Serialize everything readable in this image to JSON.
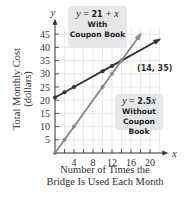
{
  "chart_data": {
    "type": "line",
    "title": "",
    "xlabel": "Number of Times the Bridge Is Used Each Month",
    "ylabel": "Total Monthly Cost (dollars)",
    "xlabel_line1": "Number of Times the",
    "xlabel_line2": "Bridge Is Used Each Month",
    "ylabel_line1": "Total Monthly Cost",
    "ylabel_line2": "(dollars)",
    "x_axis_name": "x",
    "y_axis_name": "y",
    "xlim": [
      0,
      22
    ],
    "ylim": [
      0,
      48
    ],
    "x_ticks": [
      4,
      8,
      12,
      16,
      20
    ],
    "y_ticks": [
      5,
      10,
      15,
      20,
      25,
      30,
      35,
      40,
      45
    ],
    "grid": true,
    "series": [
      {
        "name": "With Coupon Book",
        "equation": "y = 21 + x",
        "color": "#333333",
        "x": [
          0,
          2,
          4,
          10,
          12,
          14,
          22
        ],
        "y": [
          21,
          23,
          25,
          31,
          33,
          35,
          43
        ]
      },
      {
        "name": "Without Coupon Book",
        "equation": "y = 2.5x",
        "color": "#8a8a8a",
        "x": [
          0,
          2,
          4,
          10,
          12,
          14,
          18
        ],
        "y": [
          0,
          5,
          10,
          25,
          30,
          35,
          45
        ]
      }
    ],
    "annotations": [
      {
        "text": "(14, 35)",
        "x": 14,
        "y": 35
      }
    ]
  },
  "callouts": {
    "with": {
      "eq_y": "y",
      "eq_rest": " = ",
      "eq_num": "21",
      "eq_tail": " + x",
      "line2": "With",
      "line3": "Coupon Book"
    },
    "without": {
      "eq_y": "y",
      "eq_rest": " = ",
      "eq_num": "2.5",
      "eq_tail": "x",
      "line2": "Without",
      "line3": "Coupon Book"
    }
  },
  "intersection_label": "(14, 35)"
}
